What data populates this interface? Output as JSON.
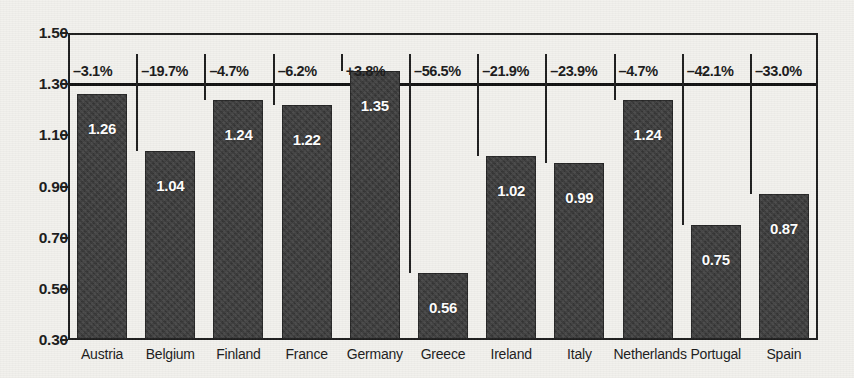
{
  "chart_data": {
    "type": "bar",
    "title": "",
    "subtitle": "",
    "xlabel": "",
    "ylabel": "",
    "ylim": [
      0.3,
      1.5
    ],
    "yticks": [
      "0.30",
      "0.50",
      "0.70",
      "0.90",
      "1.10",
      "1.30",
      "1.50"
    ],
    "ytick_values": [
      0.3,
      0.5,
      0.7,
      0.9,
      1.1,
      1.3,
      1.5
    ],
    "grid": false,
    "legend": "none",
    "reference_line": {
      "value": 1.3,
      "label": "1.30"
    },
    "categories": [
      "Austria",
      "Belgium",
      "Finland",
      "France",
      "Germany",
      "Greece",
      "Ireland",
      "Italy",
      "Netherlands",
      "Portugal",
      "Spain"
    ],
    "values": [
      1.26,
      1.04,
      1.24,
      1.22,
      1.35,
      0.56,
      1.02,
      0.99,
      1.24,
      0.75,
      0.87
    ],
    "value_labels": [
      "1.26",
      "1.04",
      "1.24",
      "1.22",
      "1.35",
      "0.56",
      "1.02",
      "0.99",
      "1.24",
      "0.75",
      "0.87"
    ],
    "percent_labels": [
      "–3.1%",
      "–19.7%",
      "–4.7%",
      "–6.2%",
      "+3.8%",
      "–56.5%",
      "–21.9%",
      "–23.9%",
      "–4.7%",
      "–42.1%",
      "–33.0%"
    ],
    "percent_values": [
      -3.1,
      -19.7,
      -4.7,
      -6.2,
      3.8,
      -56.5,
      -21.9,
      -23.9,
      -4.7,
      -42.1,
      -33.0
    ],
    "colors": {
      "bar": "#3a3a3a",
      "axis": "#1d1d1d",
      "reference_line": "#111111",
      "value_text": "#ffffff",
      "background": "#f2f1ed"
    }
  }
}
